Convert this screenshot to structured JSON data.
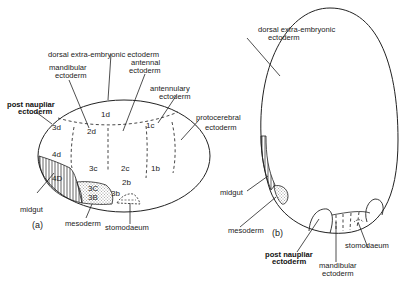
{
  "panel_a": {
    "tag": "(a)",
    "labels": {
      "dorsal_extra": "dorsal extra-embryonic ectoderm",
      "mandibular_1": "mandibular",
      "mandibular_2": "ectoderm",
      "antennal_1": "antennal",
      "antennal_2": "ectoderm",
      "antennulary_1": "antennulary",
      "antennulary_2": "ectoderm",
      "protocerebral_1": "protocerebral",
      "protocerebral_2": "ectoderm",
      "post_naupliar_1": "post naupliar",
      "post_naupliar_2": "ectoderm",
      "midgut": "midgut",
      "mesoderm": "mesoderm",
      "stomodaeum": "stomodaeum"
    },
    "cells": {
      "c1d": "1d",
      "c2d": "2d",
      "c3d": "3d",
      "c4d": "4d",
      "c1c": "1c",
      "c3c": "3c",
      "c2c": "2c",
      "c1b": "1b",
      "c2b": "2b",
      "c3b": "3b",
      "c4D": "4D",
      "c3C": "3C",
      "c3B": "3B"
    }
  },
  "panel_b": {
    "tag": "(b)",
    "labels": {
      "dorsal_extra_1": "dorsal extra-embryonic",
      "dorsal_extra_2": "ectoderm",
      "midgut": "midgut",
      "mesoderm": "mesoderm",
      "post_naupliar_1": "post naupliar",
      "post_naupliar_2": "ectoderm",
      "mandibular_1": "mandibular",
      "mandibular_2": "ectoderm",
      "stomodaeum": "stomodaeum"
    }
  }
}
